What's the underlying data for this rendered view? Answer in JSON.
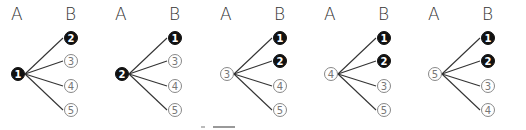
{
  "headers": {
    "a": "A",
    "b": "B"
  },
  "colors": {
    "filled": "#111111",
    "open_border": "#888888",
    "line": "#333333"
  },
  "trees": [
    {
      "root": {
        "label": "1",
        "filled": true
      },
      "leaves": [
        {
          "label": "2",
          "filled": true
        },
        {
          "label": "3",
          "filled": false
        },
        {
          "label": "4",
          "filled": false
        },
        {
          "label": "5",
          "filled": false
        }
      ]
    },
    {
      "root": {
        "label": "2",
        "filled": true
      },
      "leaves": [
        {
          "label": "1",
          "filled": true
        },
        {
          "label": "3",
          "filled": false
        },
        {
          "label": "4",
          "filled": false
        },
        {
          "label": "5",
          "filled": false
        }
      ]
    },
    {
      "root": {
        "label": "3",
        "filled": false
      },
      "leaves": [
        {
          "label": "1",
          "filled": true
        },
        {
          "label": "2",
          "filled": true
        },
        {
          "label": "4",
          "filled": false
        },
        {
          "label": "5",
          "filled": false
        }
      ]
    },
    {
      "root": {
        "label": "4",
        "filled": false
      },
      "leaves": [
        {
          "label": "1",
          "filled": true
        },
        {
          "label": "2",
          "filled": true
        },
        {
          "label": "3",
          "filled": false
        },
        {
          "label": "5",
          "filled": false
        }
      ]
    },
    {
      "root": {
        "label": "5",
        "filled": false
      },
      "leaves": [
        {
          "label": "1",
          "filled": true
        },
        {
          "label": "2",
          "filled": true
        },
        {
          "label": "3",
          "filled": false
        },
        {
          "label": "4",
          "filled": false
        }
      ]
    }
  ]
}
